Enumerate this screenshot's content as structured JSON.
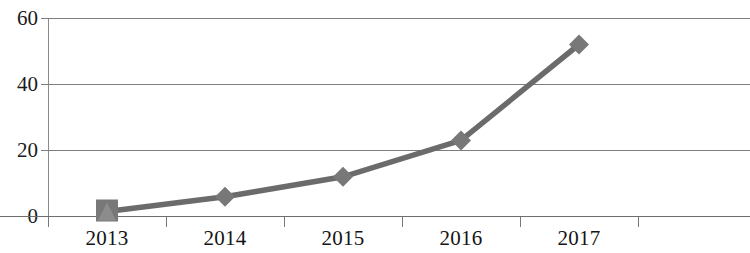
{
  "chart_data": {
    "type": "line",
    "title": "",
    "subtitle": "",
    "xlabel": "",
    "ylabel": "",
    "categories": [
      "2013",
      "2014",
      "2015",
      "2016",
      "2017"
    ],
    "values": [
      1.5,
      6,
      12,
      23,
      52
    ],
    "series": [
      {
        "name": "",
        "values": [
          1.5,
          6,
          12,
          23,
          52
        ],
        "color": "#6b6b6b",
        "marker": "diamond"
      }
    ],
    "ylim": [
      0,
      60
    ],
    "y_ticks": [
      0,
      20,
      40,
      60
    ],
    "y_tick_labels": [
      "0",
      "20",
      "40",
      "60"
    ],
    "x_tick_labels": [
      "2013",
      "2014",
      "2015",
      "2016",
      "2017"
    ],
    "grid": true,
    "grid_axis": "y",
    "legend": false,
    "legend_position": "none",
    "annotations": [],
    "colors": {
      "line": "#6b6b6b",
      "marker": "#787878",
      "gridline": "#7d7d7d",
      "axis": "#6e6e6e",
      "text": "#141414",
      "background": "#ffffff"
    }
  },
  "axes": {
    "y_labels": [
      "60",
      "40",
      "20",
      "0"
    ],
    "x_labels": [
      "2013",
      "2014",
      "2015",
      "2016",
      "2017"
    ]
  }
}
